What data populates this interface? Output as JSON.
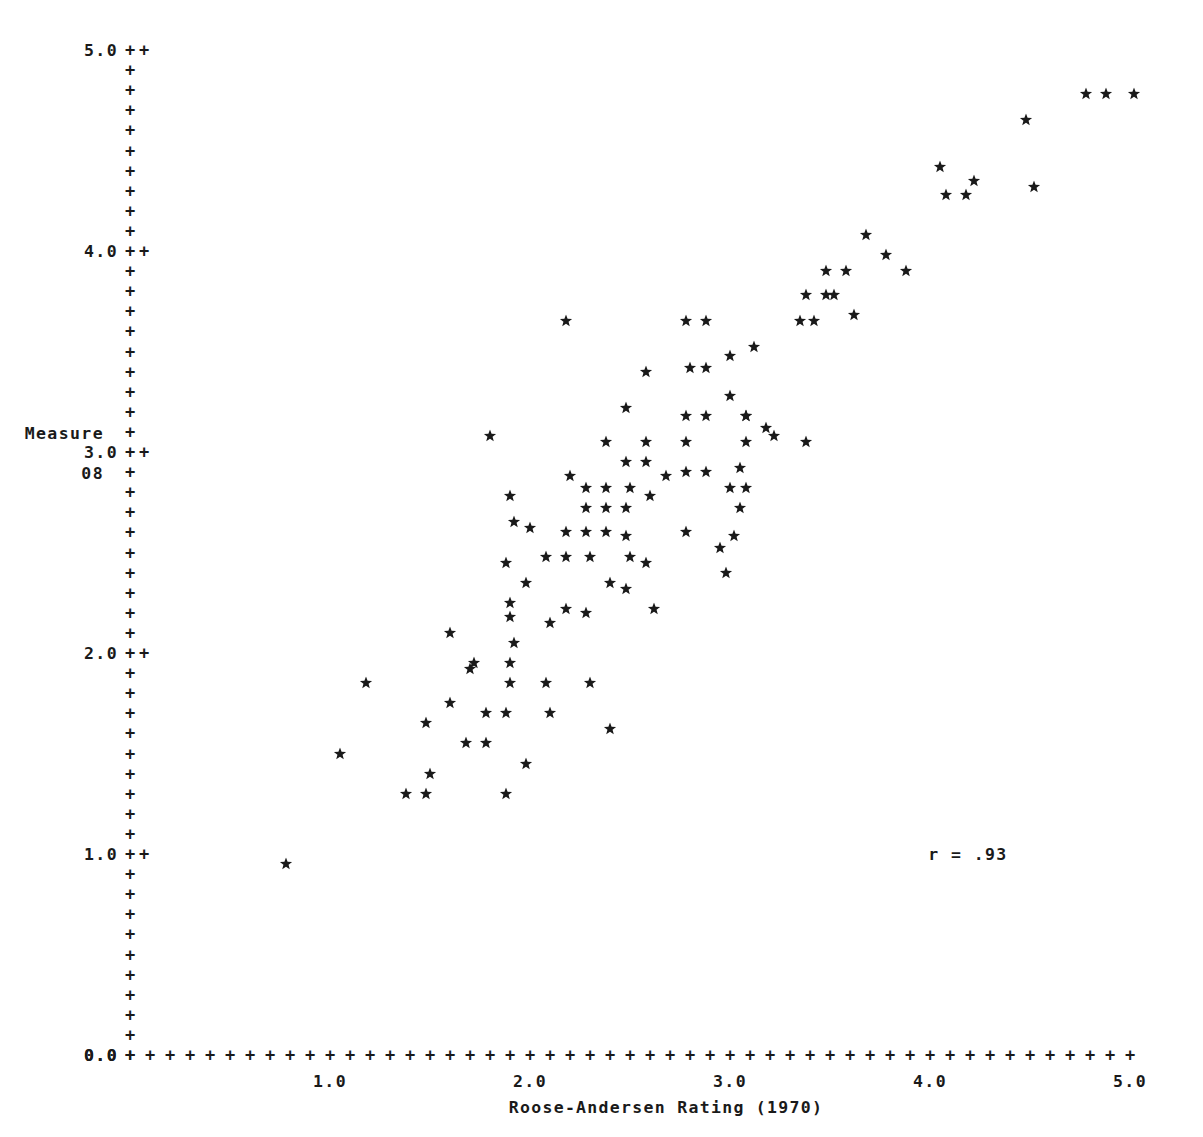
{
  "axes": {
    "y_caption_line1": "Measure",
    "y_caption_line2": "08",
    "x_title": "Roose-Andersen Rating (1970)",
    "y_tick_labels": [
      "0.0",
      "1.0",
      "2.0",
      "3.0",
      "4.0",
      "5.0"
    ],
    "x_tick_labels": [
      "0.0",
      "1.0",
      "2.0",
      "3.0",
      "4.0",
      "5.0"
    ],
    "tick_glyph": "+",
    "origin_label": "0.0"
  },
  "annotation": {
    "correlation_text": "r = .93"
  },
  "colors": {
    "ink": "#1a1a1a",
    "paper": "#ffffff"
  },
  "chart_data": {
    "type": "scatter",
    "title": "",
    "xlabel": "Roose-Andersen Rating (1970)",
    "ylabel": "Measure 08",
    "xlim": [
      0.0,
      5.0
    ],
    "ylim": [
      0.0,
      5.0
    ],
    "xticks": [
      0.0,
      1.0,
      2.0,
      3.0,
      4.0,
      5.0
    ],
    "yticks": [
      0.0,
      1.0,
      2.0,
      3.0,
      4.0,
      5.0
    ],
    "minor_tick_step": 0.1,
    "grid": false,
    "legend": null,
    "marker": "star",
    "annotations": [
      {
        "text": "r = .93",
        "x": 4.05,
        "y": 1.0
      }
    ],
    "statistics": {
      "r": 0.93
    },
    "n_points": 108,
    "points": [
      [
        0.78,
        0.95
      ],
      [
        1.05,
        1.5
      ],
      [
        1.18,
        1.85
      ],
      [
        1.38,
        1.3
      ],
      [
        1.48,
        1.3
      ],
      [
        1.5,
        1.4
      ],
      [
        1.48,
        1.65
      ],
      [
        1.6,
        1.75
      ],
      [
        1.68,
        1.55
      ],
      [
        1.78,
        1.55
      ],
      [
        1.6,
        2.1
      ],
      [
        1.72,
        1.95
      ],
      [
        1.88,
        1.3
      ],
      [
        1.78,
        1.7
      ],
      [
        1.88,
        1.7
      ],
      [
        1.9,
        1.85
      ],
      [
        1.9,
        1.95
      ],
      [
        1.92,
        2.05
      ],
      [
        1.9,
        2.25
      ],
      [
        1.88,
        2.45
      ],
      [
        1.92,
        2.65
      ],
      [
        2.1,
        2.15
      ],
      [
        2.1,
        1.7
      ],
      [
        2.08,
        1.85
      ],
      [
        2.3,
        1.85
      ],
      [
        1.8,
        3.08
      ],
      [
        1.9,
        2.78
      ],
      [
        2.0,
        2.62
      ],
      [
        2.18,
        2.6
      ],
      [
        2.28,
        2.6
      ],
      [
        2.38,
        2.6
      ],
      [
        2.28,
        2.72
      ],
      [
        2.38,
        2.72
      ],
      [
        2.48,
        2.72
      ],
      [
        2.28,
        2.82
      ],
      [
        2.38,
        2.82
      ],
      [
        2.5,
        2.82
      ],
      [
        2.2,
        2.88
      ],
      [
        2.38,
        3.05
      ],
      [
        2.48,
        2.95
      ],
      [
        2.58,
        2.95
      ],
      [
        2.48,
        3.22
      ],
      [
        2.18,
        3.65
      ],
      [
        2.5,
        2.48
      ],
      [
        2.48,
        2.32
      ],
      [
        2.58,
        2.45
      ],
      [
        2.78,
        2.6
      ],
      [
        2.78,
        2.9
      ],
      [
        2.88,
        2.9
      ],
      [
        2.78,
        3.05
      ],
      [
        2.78,
        3.18
      ],
      [
        2.88,
        3.18
      ],
      [
        2.8,
        3.42
      ],
      [
        2.88,
        3.42
      ],
      [
        2.78,
        3.65
      ],
      [
        2.88,
        3.65
      ],
      [
        3.0,
        3.28
      ],
      [
        3.08,
        3.18
      ],
      [
        3.08,
        3.05
      ],
      [
        3.08,
        3.18
      ],
      [
        3.0,
        3.48
      ],
      [
        3.12,
        3.52
      ],
      [
        3.18,
        3.12
      ],
      [
        3.0,
        2.82
      ],
      [
        3.08,
        2.82
      ],
      [
        3.05,
        2.92
      ],
      [
        3.05,
        2.72
      ],
      [
        2.95,
        2.52
      ],
      [
        3.02,
        2.58
      ],
      [
        2.98,
        2.4
      ],
      [
        2.62,
        2.22
      ],
      [
        3.22,
        3.08
      ],
      [
        3.38,
        3.05
      ],
      [
        3.35,
        3.65
      ],
      [
        3.42,
        3.65
      ],
      [
        3.38,
        3.78
      ],
      [
        3.48,
        3.78
      ],
      [
        3.48,
        3.9
      ],
      [
        3.58,
        3.9
      ],
      [
        3.52,
        3.78
      ],
      [
        3.62,
        3.68
      ],
      [
        3.68,
        4.08
      ],
      [
        3.78,
        3.98
      ],
      [
        3.88,
        3.9
      ],
      [
        4.05,
        4.42
      ],
      [
        4.08,
        4.28
      ],
      [
        4.18,
        4.28
      ],
      [
        4.22,
        4.35
      ],
      [
        4.48,
        4.65
      ],
      [
        4.52,
        4.32
      ],
      [
        4.78,
        4.78
      ],
      [
        4.88,
        4.78
      ],
      [
        5.02,
        4.78
      ],
      [
        2.48,
        2.58
      ],
      [
        2.3,
        2.48
      ],
      [
        2.18,
        2.48
      ],
      [
        2.4,
        2.35
      ],
      [
        2.28,
        2.2
      ],
      [
        2.18,
        2.22
      ],
      [
        1.98,
        2.35
      ],
      [
        2.08,
        2.48
      ],
      [
        1.9,
        2.18
      ],
      [
        2.6,
        2.78
      ],
      [
        2.58,
        3.05
      ],
      [
        2.68,
        2.88
      ],
      [
        1.98,
        1.45
      ],
      [
        2.4,
        1.62
      ],
      [
        1.7,
        1.92
      ],
      [
        2.58,
        3.4
      ]
    ]
  }
}
